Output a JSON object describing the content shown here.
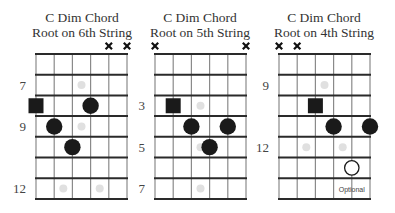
{
  "diagrams": [
    {
      "title_line1": "C Dim Chord",
      "title_line2": "Root on 6th String",
      "first_fret": 6,
      "fret_count": 7,
      "fret_labels": [
        7,
        9,
        12
      ],
      "muted_strings": [
        2,
        1
      ],
      "inlays": [
        {
          "fret": 7,
          "strings": [
            3.5
          ]
        },
        {
          "fret": 9,
          "strings": [
            3.5
          ]
        },
        {
          "fret": 12,
          "strings": [
            4.5,
            2.5
          ]
        }
      ],
      "notes": [
        {
          "string": 6,
          "fret": 8,
          "type": "root"
        },
        {
          "string": 3,
          "fret": 8,
          "type": "note"
        },
        {
          "string": 5,
          "fret": 9,
          "type": "note"
        },
        {
          "string": 4,
          "fret": 10,
          "type": "note"
        }
      ]
    },
    {
      "title_line1": "C Dim Chord",
      "title_line2": "Root on 5th String",
      "first_fret": 1,
      "fret_count": 7,
      "fret_labels": [
        3,
        5,
        7
      ],
      "muted_strings": [
        6,
        1
      ],
      "inlays": [
        {
          "fret": 3,
          "strings": [
            3.5
          ]
        },
        {
          "fret": 5,
          "strings": [
            3.5
          ]
        },
        {
          "fret": 7,
          "strings": [
            3.5
          ]
        }
      ],
      "notes": [
        {
          "string": 5,
          "fret": 3,
          "type": "root"
        },
        {
          "string": 4,
          "fret": 4,
          "type": "note"
        },
        {
          "string": 2,
          "fret": 4,
          "type": "note"
        },
        {
          "string": 3,
          "fret": 5,
          "type": "note"
        }
      ]
    },
    {
      "title_line1": "C Dim Chord",
      "title_line2": "Root on 4th String",
      "first_fret": 8,
      "fret_count": 7,
      "fret_labels": [
        9,
        12
      ],
      "muted_strings": [
        6,
        5
      ],
      "inlays": [
        {
          "fret": 9,
          "strings": [
            3.5
          ]
        },
        {
          "fret": 12,
          "strings": [
            4.5,
            2.5
          ]
        }
      ],
      "notes": [
        {
          "string": 4,
          "fret": 10,
          "type": "root"
        },
        {
          "string": 3,
          "fret": 11,
          "type": "note"
        },
        {
          "string": 1,
          "fret": 11,
          "type": "note"
        },
        {
          "string": 2,
          "fret": 13,
          "type": "optional"
        }
      ],
      "optional_label": "Optional"
    }
  ],
  "colors": {
    "note": "#1a1a1a",
    "line": "#2a2a2a",
    "string_line": "#8a8a8a",
    "inlay": "#e0e0e0"
  }
}
